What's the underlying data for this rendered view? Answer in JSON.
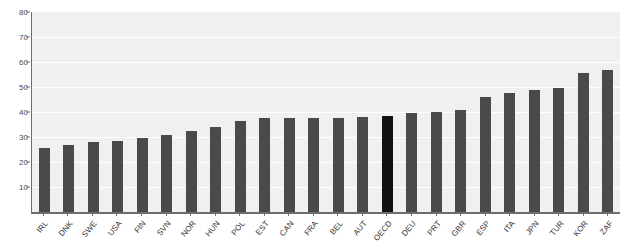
{
  "chart_data": {
    "type": "bar",
    "title": "",
    "xlabel": "",
    "ylabel": "",
    "ylim": [
      0,
      80
    ],
    "ytick_values": [
      0,
      10,
      20,
      30,
      40,
      50,
      60,
      70,
      80
    ],
    "ytick_labels": [
      "0",
      "10",
      "20",
      "30",
      "40",
      "50",
      "60",
      "70",
      "80"
    ],
    "grid": true,
    "legend": "none",
    "highlight_category": "OECD",
    "highlight_color": "#121212",
    "bar_color": "#4a4a4a",
    "plot_background": "#f0f0f0",
    "categories": [
      "IRL",
      "DNK",
      "SWE",
      "USA",
      "FIN",
      "SVN",
      "NOR",
      "HUN",
      "POL",
      "EST",
      "CAN",
      "FRA",
      "BEL",
      "AUT",
      "OECD",
      "DEU",
      "PRT",
      "GBR",
      "ESP",
      "ITA",
      "JPN",
      "TUR",
      "KOR",
      "ZAF"
    ],
    "values": [
      25.5,
      27,
      28,
      28.5,
      29.5,
      31,
      32.5,
      34,
      36.5,
      37.5,
      37.5,
      37.5,
      37.5,
      38,
      38.5,
      39.5,
      40,
      41,
      46,
      47.5,
      49,
      49.5,
      55.5,
      57
    ]
  }
}
